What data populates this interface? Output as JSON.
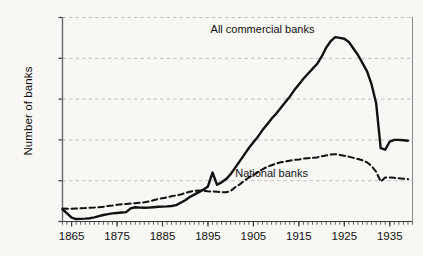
{
  "chart_data": {
    "type": "line",
    "title": "",
    "xlabel": "",
    "ylabel": "Number of banks",
    "xlim": [
      1863,
      1940
    ],
    "ylim": [
      0,
      25000
    ],
    "grid": true,
    "legend_position": "inline-annotation",
    "y_ticks": [
      0,
      5000,
      10000,
      15000,
      20000,
      25000
    ],
    "y_tick_labels": [
      "0",
      "5,000",
      "10,000",
      "15,000",
      "20,000",
      "25,000"
    ],
    "x_ticks": [
      1865,
      1875,
      1885,
      1895,
      1905,
      1915,
      1925,
      1935
    ],
    "x_tick_labels": [
      "1865",
      "1875",
      "1885",
      "1895",
      "1905",
      "1915",
      "1925",
      "1935"
    ],
    "x_minor_tick_step": 1,
    "series": [
      {
        "name": "All commercial banks",
        "style": "solid",
        "color": "#111111",
        "label_x": 1907,
        "label_y": 23600,
        "x": [
          1863,
          1864,
          1865,
          1866,
          1867,
          1868,
          1869,
          1870,
          1871,
          1872,
          1873,
          1874,
          1875,
          1876,
          1877,
          1878,
          1879,
          1880,
          1881,
          1882,
          1883,
          1884,
          1885,
          1886,
          1887,
          1888,
          1889,
          1890,
          1891,
          1892,
          1893,
          1894,
          1895,
          1896,
          1897,
          1898,
          1899,
          1900,
          1901,
          1902,
          1903,
          1904,
          1905,
          1906,
          1907,
          1908,
          1909,
          1910,
          1911,
          1912,
          1913,
          1914,
          1915,
          1916,
          1917,
          1918,
          1919,
          1920,
          1921,
          1922,
          1923,
          1924,
          1925,
          1926,
          1927,
          1928,
          1929,
          1930,
          1931,
          1932,
          1933,
          1934,
          1935,
          1936,
          1937,
          1938,
          1939
        ],
        "y": [
          1500,
          1000,
          480,
          300,
          320,
          350,
          400,
          500,
          650,
          800,
          900,
          1000,
          1050,
          1100,
          1150,
          1600,
          1750,
          1700,
          1680,
          1700,
          1750,
          1800,
          1820,
          1850,
          1900,
          2000,
          2300,
          2600,
          3000,
          3300,
          3600,
          3900,
          4300,
          6000,
          4500,
          4800,
          5200,
          5800,
          6600,
          7400,
          8200,
          9000,
          9700,
          10400,
          11200,
          11900,
          12600,
          13200,
          13900,
          14600,
          15300,
          16100,
          16800,
          17500,
          18100,
          18700,
          19300,
          20200,
          21300,
          22100,
          22600,
          22500,
          22400,
          22000,
          21200,
          20400,
          19400,
          18400,
          16800,
          14500,
          9000,
          8800,
          9800,
          10000,
          10000,
          9950,
          9900
        ]
      },
      {
        "name": "National banks",
        "style": "dashed",
        "color": "#111111",
        "label_x": 1909,
        "label_y": 5900,
        "x": [
          1863,
          1864,
          1865,
          1866,
          1867,
          1868,
          1869,
          1870,
          1871,
          1872,
          1873,
          1874,
          1875,
          1876,
          1877,
          1878,
          1879,
          1880,
          1881,
          1882,
          1883,
          1884,
          1885,
          1886,
          1887,
          1888,
          1889,
          1890,
          1891,
          1892,
          1893,
          1894,
          1895,
          1896,
          1897,
          1898,
          1899,
          1900,
          1901,
          1902,
          1903,
          1904,
          1905,
          1906,
          1907,
          1908,
          1909,
          1910,
          1911,
          1912,
          1913,
          1914,
          1915,
          1916,
          1917,
          1918,
          1919,
          1920,
          1921,
          1922,
          1923,
          1924,
          1925,
          1926,
          1927,
          1928,
          1929,
          1930,
          1931,
          1932,
          1933,
          1934,
          1935,
          1936,
          1937,
          1938,
          1939
        ],
        "y": [
          1600,
          1550,
          1550,
          1600,
          1620,
          1650,
          1700,
          1720,
          1760,
          1800,
          1900,
          1950,
          2050,
          2100,
          2150,
          2200,
          2250,
          2300,
          2350,
          2450,
          2600,
          2750,
          2850,
          2950,
          3100,
          3200,
          3300,
          3500,
          3650,
          3750,
          3800,
          3750,
          3700,
          3680,
          3650,
          3600,
          3580,
          3750,
          4200,
          4550,
          5000,
          5400,
          5700,
          6050,
          6400,
          6700,
          6900,
          7100,
          7250,
          7350,
          7450,
          7550,
          7600,
          7700,
          7750,
          7800,
          7850,
          8000,
          8100,
          8200,
          8250,
          8150,
          8050,
          7950,
          7800,
          7650,
          7500,
          7250,
          6800,
          6100,
          4900,
          5400,
          5400,
          5350,
          5300,
          5250,
          5200
        ]
      }
    ]
  },
  "axis": {
    "y_label": "Number of banks"
  }
}
